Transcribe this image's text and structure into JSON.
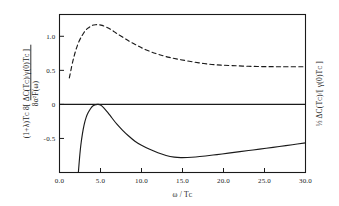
{
  "chart_data": {
    "type": "line",
    "title": "",
    "xlabel": "ω / Tᴄ",
    "ylabel_left_line1": "(1+λ)Tᴄ  8[ ΔC(Tᴄ)/γ(0)Tᴄ ]",
    "ylabel_left_line2": "8α²F(ω)",
    "ylabel_right": "⅓ ΔC(Tᴄ)/[ γ(0)Tᴄ ]",
    "xlim": [
      0.0,
      30.0
    ],
    "ylim": [
      -1.0,
      1.32
    ],
    "grid": false,
    "legend": "none",
    "xticks": [
      0.0,
      5.0,
      10.0,
      15.0,
      20.0,
      25.0,
      30.0
    ],
    "xtick_labels": [
      "0.0",
      "5.0",
      "10.0",
      "15.0",
      "20.0",
      "25.0",
      "30.0"
    ],
    "yticks": [
      1.0,
      0.5,
      0.0,
      -0.5
    ],
    "ytick_labels": [
      "1.0",
      "0.5",
      "0",
      "-0.5"
    ],
    "zero_line": 0.0,
    "series": [
      {
        "name": "dashed-curve",
        "style": "dashed",
        "points": [
          [
            1.2,
            0.39
          ],
          [
            1.6,
            0.62
          ],
          [
            2.0,
            0.8
          ],
          [
            2.4,
            0.93
          ],
          [
            2.8,
            1.02
          ],
          [
            3.2,
            1.09
          ],
          [
            3.6,
            1.13
          ],
          [
            4.0,
            1.16
          ],
          [
            4.4,
            1.17
          ],
          [
            4.8,
            1.17
          ],
          [
            5.2,
            1.16
          ],
          [
            5.8,
            1.13
          ],
          [
            6.4,
            1.09
          ],
          [
            7.0,
            1.04
          ],
          [
            7.8,
            0.98
          ],
          [
            8.6,
            0.92
          ],
          [
            9.4,
            0.87
          ],
          [
            10.2,
            0.82
          ],
          [
            11.2,
            0.77
          ],
          [
            12.2,
            0.73
          ],
          [
            13.4,
            0.69
          ],
          [
            14.6,
            0.66
          ],
          [
            16.0,
            0.63
          ],
          [
            17.6,
            0.6
          ],
          [
            19.2,
            0.58
          ],
          [
            21.0,
            0.57
          ],
          [
            23.0,
            0.56
          ],
          [
            25.0,
            0.555
          ],
          [
            27.0,
            0.553
          ],
          [
            30.0,
            0.552
          ]
        ]
      },
      {
        "name": "solid-curve",
        "style": "solid",
        "points": [
          [
            2.3,
            -1.0
          ],
          [
            2.45,
            -0.78
          ],
          [
            2.6,
            -0.6
          ],
          [
            2.8,
            -0.43
          ],
          [
            3.0,
            -0.3
          ],
          [
            3.25,
            -0.19
          ],
          [
            3.5,
            -0.12
          ],
          [
            3.8,
            -0.06
          ],
          [
            4.1,
            -0.02
          ],
          [
            4.45,
            -0.003
          ],
          [
            4.7,
            0.0
          ],
          [
            5.0,
            -0.01
          ],
          [
            5.4,
            -0.05
          ],
          [
            5.9,
            -0.12
          ],
          [
            6.4,
            -0.2
          ],
          [
            7.0,
            -0.29
          ],
          [
            7.7,
            -0.38
          ],
          [
            8.4,
            -0.46
          ],
          [
            9.2,
            -0.54
          ],
          [
            10.0,
            -0.6
          ],
          [
            11.0,
            -0.66
          ],
          [
            12.0,
            -0.71
          ],
          [
            13.0,
            -0.75
          ],
          [
            14.0,
            -0.775
          ],
          [
            14.8,
            -0.782
          ],
          [
            15.6,
            -0.78
          ],
          [
            16.6,
            -0.772
          ],
          [
            17.8,
            -0.757
          ],
          [
            19.2,
            -0.737
          ],
          [
            20.6,
            -0.716
          ],
          [
            22.0,
            -0.694
          ],
          [
            23.6,
            -0.669
          ],
          [
            25.2,
            -0.644
          ],
          [
            26.8,
            -0.618
          ],
          [
            28.4,
            -0.592
          ],
          [
            30.0,
            -0.566
          ]
        ]
      }
    ]
  },
  "colors": {
    "axis": "#1a1a1a",
    "curve": "#1a1a1a",
    "background": "#ffffff"
  }
}
